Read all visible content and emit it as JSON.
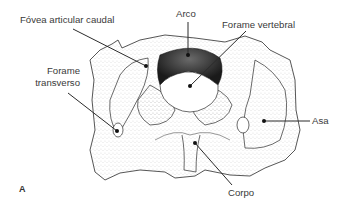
{
  "figure": {
    "panel_letter": "A",
    "colors": {
      "line": "#2b2b2b",
      "stipple": "#555555",
      "text": "#3a3a3a",
      "background": "#ffffff"
    }
  },
  "labels": [
    {
      "id": "fovea",
      "text": "Fóvea articular caudal"
    },
    {
      "id": "arco",
      "text": "Arco"
    },
    {
      "id": "forame_vertebral",
      "text": "Forame vertebral"
    },
    {
      "id": "forame_transverso_1",
      "text": "Forame"
    },
    {
      "id": "forame_transverso_2",
      "text": "transverso"
    },
    {
      "id": "asa",
      "text": "Asa"
    },
    {
      "id": "corpo",
      "text": "Corpo"
    }
  ]
}
